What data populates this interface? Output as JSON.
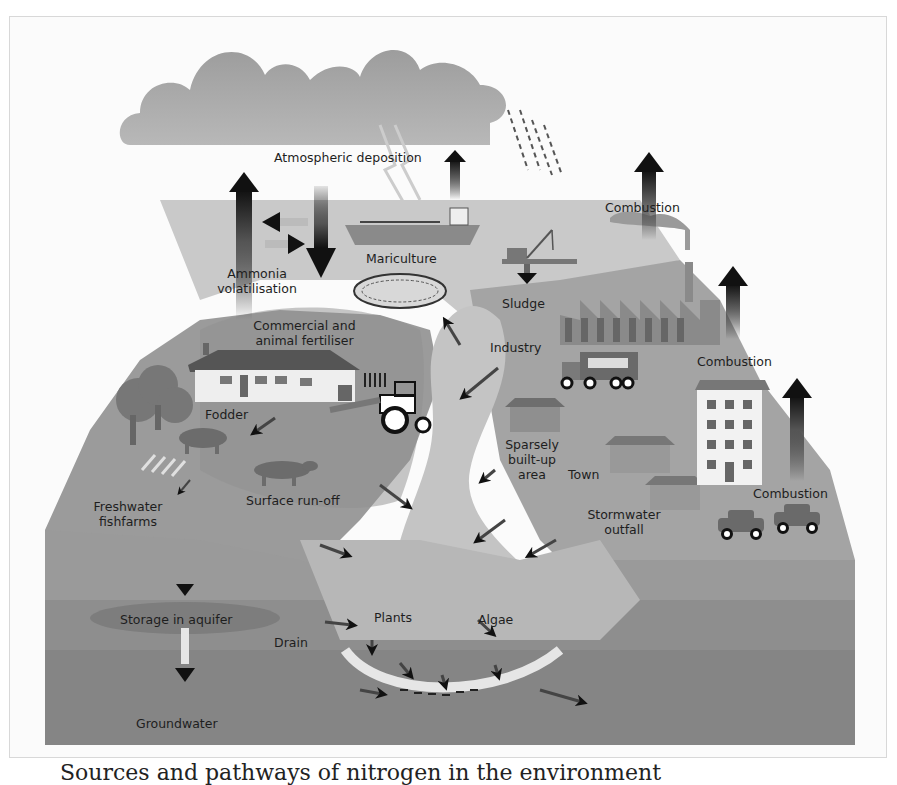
{
  "diagram": {
    "colors": {
      "sky": "#fbfbfb",
      "cloud": "#a8a8a8",
      "land_left": "#9a9a9a",
      "land_right": "#a3a3a3",
      "river": "#c4c4c4",
      "sea": "#c8c8c8",
      "ground": "#8d8d8d",
      "arrow": "#111111"
    },
    "labels": {
      "atmospheric_deposition": "Atmospheric deposition",
      "ammonia_volatilisation": "Ammonia volatilisation",
      "mariculture": "Mariculture",
      "combustion_top": "Combustion",
      "sludge": "Sludge",
      "commercial_fertiliser": "Commercial and animal fertiliser",
      "industry": "Industry",
      "combustion_middle": "Combustion",
      "fodder": "Fodder",
      "sparsely_built_up": "Sparsely built-up area",
      "town": "Town",
      "combustion_bottom": "Combustion",
      "freshwater_fishfarms": "Freshwater fishfarms",
      "surface_runoff": "Surface run-off",
      "stormwater_outfall": "Stormwater outfall",
      "storage_in_aquifer": "Storage in aquifer",
      "drain": "Drain",
      "plants": "Plants",
      "algae": "Algae",
      "groundwater": "Groundwater"
    },
    "nodes": [
      "Clouds / rain",
      "Ship",
      "Mariculture net",
      "Dredger (sludge)",
      "Factory",
      "Truck",
      "Farmhouse",
      "Tractor",
      "Cows",
      "Trees",
      "Houses",
      "Apartment block",
      "Cars",
      "River",
      "Sea sediment"
    ]
  },
  "caption": {
    "text": "Sources and pathways of nitrogen in the environment"
  }
}
